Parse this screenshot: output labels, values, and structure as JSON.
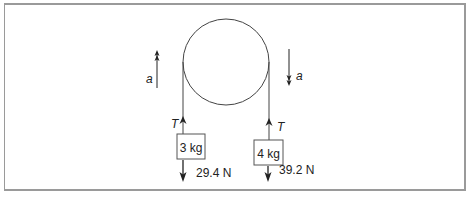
{
  "diagram": {
    "type": "atwood-machine",
    "pulley": {
      "cx": 226,
      "cy": 62,
      "r": 43
    },
    "left_mass": {
      "label": "3 kg",
      "weight_label": "29.4 N",
      "tension_label": "T",
      "acceleration_label": "a",
      "acceleration_direction": "up"
    },
    "right_mass": {
      "label": "4 kg",
      "weight_label": "39.2 N",
      "tension_label": "T",
      "acceleration_label": "a",
      "acceleration_direction": "down"
    },
    "colors": {
      "stroke": "#333333",
      "frame": "#9a9a9a",
      "text": "#222222"
    }
  }
}
